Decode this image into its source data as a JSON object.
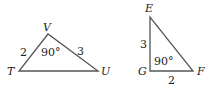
{
  "triangles": [
    {
      "name": "TUV",
      "vertices": {
        "T": "T",
        "U": "U",
        "V": "V"
      },
      "sides": {
        "TV": "2",
        "VU": "3"
      },
      "angle_V": "90°"
    },
    {
      "name": "EFG",
      "vertices": {
        "E": "E",
        "F": "F",
        "G": "G"
      },
      "sides": {
        "EG": "3",
        "GF": "2"
      },
      "angle_G": "90°"
    }
  ],
  "colors": {
    "stroke": "#555555",
    "text": "#222222"
  }
}
